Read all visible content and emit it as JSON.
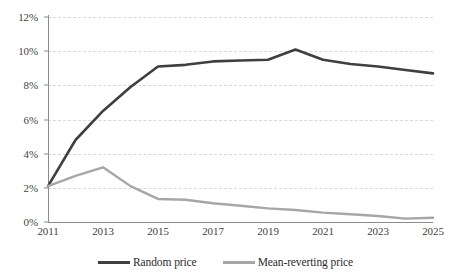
{
  "chart_data": {
    "type": "line",
    "title": "",
    "subtitle": "",
    "xlabel": "",
    "ylabel": "",
    "x": [
      2011,
      2012,
      2013,
      2014,
      2015,
      2016,
      2017,
      2018,
      2019,
      2020,
      2021,
      2022,
      2023,
      2024,
      2025
    ],
    "xlim": [
      2011,
      2025
    ],
    "ylim": [
      0,
      12
    ],
    "y_tick_labels": [
      "0%",
      "2%",
      "4%",
      "6%",
      "8%",
      "10%",
      "12%"
    ],
    "y_tick_values": [
      0,
      2,
      4,
      6,
      8,
      10,
      12
    ],
    "x_tick_labels": [
      "2011",
      "2013",
      "2015",
      "2017",
      "2019",
      "2021",
      "2023",
      "2025"
    ],
    "x_tick_values": [
      2011,
      2013,
      2015,
      2017,
      2019,
      2021,
      2023,
      2025
    ],
    "grid": "horizontal-dashed",
    "legend_position": "bottom-center",
    "series": [
      {
        "name": "Random price",
        "color": "#3f3f3f",
        "values": [
          2.1,
          4.8,
          6.5,
          7.9,
          9.1,
          9.2,
          9.4,
          9.45,
          9.5,
          10.1,
          9.5,
          9.25,
          9.1,
          8.9,
          8.7
        ]
      },
      {
        "name": "Mean-reverting price",
        "color": "#a6a6a6",
        "values": [
          2.1,
          2.7,
          3.2,
          2.1,
          1.35,
          1.3,
          1.1,
          0.95,
          0.8,
          0.7,
          0.55,
          0.45,
          0.35,
          0.2,
          0.25
        ]
      }
    ]
  },
  "legend": {
    "items": [
      {
        "label": "Random price",
        "color": "#3f3f3f"
      },
      {
        "label": "Mean-reverting price",
        "color": "#a6a6a6"
      }
    ]
  }
}
